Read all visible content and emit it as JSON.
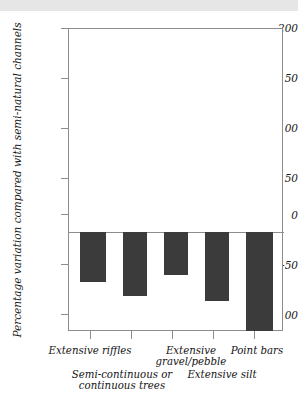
{
  "header": {
    "band_color": "#e6e6e6"
  },
  "chart_data": {
    "type": "bar",
    "title": "",
    "subtitle": "",
    "xlabel": "",
    "ylabel": "Percentage variation compared with semi-natural channels",
    "categories": [
      "Extensive riffles",
      "Semi-continuous or continuous trees",
      "Extensive gravel/pebble",
      "Extensive silt",
      "Point bars"
    ],
    "values": [
      -50,
      -64,
      -43,
      -69,
      -99
    ],
    "ylim": [
      -100,
      200
    ],
    "yticks": [
      200,
      150,
      100,
      50,
      0,
      -50,
      -100
    ],
    "ytick_labels": [
      "200",
      "150",
      "100",
      "50",
      "0",
      "-50",
      "-100"
    ],
    "grid": false,
    "legend": null,
    "bar_color": "#3b3b3b",
    "axis_color": "#8c8c8c",
    "zero_line": 0
  },
  "axis": {
    "tick_200": "200",
    "tick_150": "150",
    "tick_100": "100",
    "tick_50": "50",
    "tick_0": "0",
    "tick_m50": "-50",
    "tick_m100": "-100"
  },
  "xlabels": {
    "cat1": "Extensive riffles",
    "cat2_line1": "Semi-continuous or",
    "cat2_line2": "continuous trees",
    "cat3_line1": "Extensive",
    "cat3_line2": "gravel/pebble",
    "cat4": "Extensive silt",
    "cat5": "Point bars"
  }
}
